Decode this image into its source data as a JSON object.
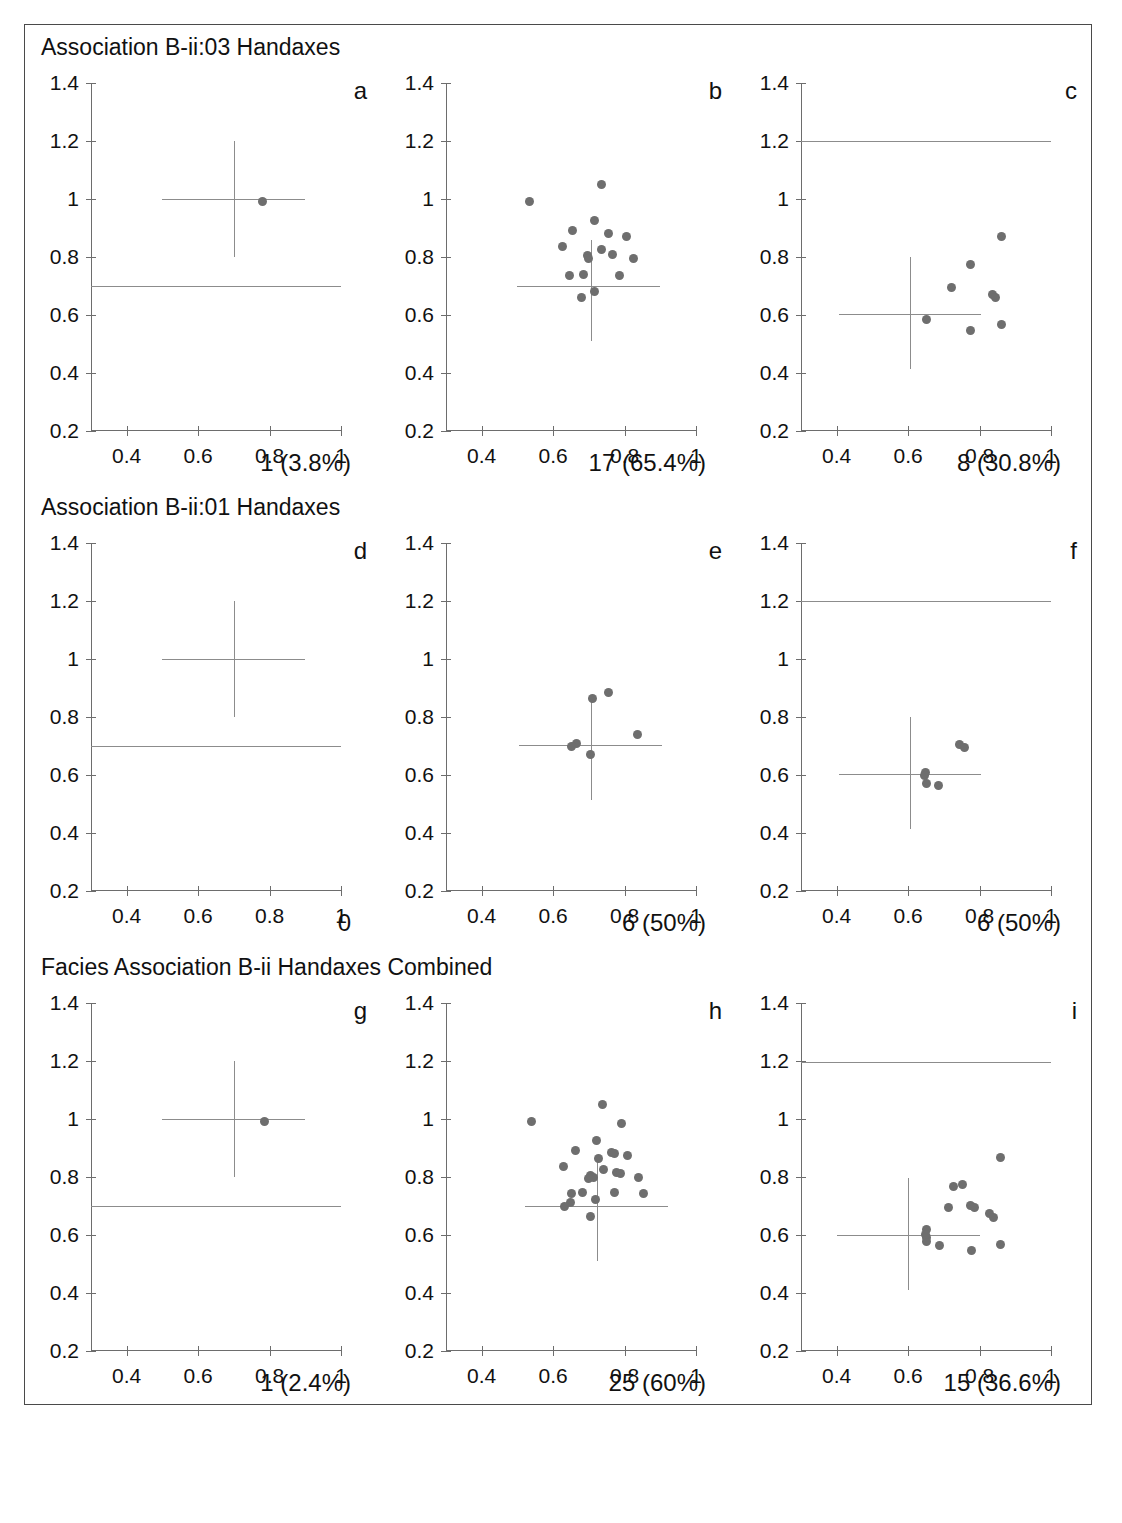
{
  "figure": {
    "rows": [
      {
        "title": "Association B-ii:03 Handaxes",
        "panels": [
          {
            "letter": "a",
            "count_label": "1 (3.8%)"
          },
          {
            "letter": "b",
            "count_label": "17 (65.4%)"
          },
          {
            "letter": "c",
            "count_label": "8 (30.8%)"
          }
        ]
      },
      {
        "title": "Association B-ii:01 Handaxes",
        "panels": [
          {
            "letter": "d",
            "count_label": "0"
          },
          {
            "letter": "e",
            "count_label": "6 (50%)"
          },
          {
            "letter": "f",
            "count_label": "6 (50%)"
          }
        ]
      },
      {
        "title": "Facies Association B-ii Handaxes Combined",
        "panels": [
          {
            "letter": "g",
            "count_label": "1 (2.4%)"
          },
          {
            "letter": "h",
            "count_label": "25 (60%)"
          },
          {
            "letter": "i",
            "count_label": "15 (36.6%)"
          }
        ]
      }
    ]
  },
  "chart_data": [
    {
      "id": "a",
      "type": "scatter",
      "title": "Association B-ii:03 Handaxes",
      "panel_letter": "a",
      "xlabel": "",
      "ylabel": "",
      "xlim": [
        0.3,
        1.0
      ],
      "ylim": [
        0.2,
        1.4
      ],
      "xticks": [
        0.4,
        0.6,
        0.8,
        1.0
      ],
      "xtick_labels": [
        "0.4",
        "0.6",
        "0.8",
        "1"
      ],
      "yticks": [
        0.2,
        0.4,
        0.6,
        0.8,
        1.0,
        1.2,
        1.4
      ],
      "ytick_labels": [
        "0.2",
        "0.4",
        "0.6",
        "0.8",
        "1",
        "1.2",
        "1.4"
      ],
      "grid": false,
      "legend": "none",
      "marker_color": "#6e6e6e",
      "annotation": "1 (3.8%)",
      "n_points": 1,
      "points": [
        {
          "x": 0.78,
          "y": 0.99
        }
      ],
      "crosshair": {
        "cx": 0.7,
        "cy": 1.0,
        "x_from": 0.5,
        "x_to": 0.9,
        "y_from": 0.8,
        "y_to": 1.2
      },
      "reference_lines": [
        {
          "orientation": "horizontal",
          "y": 0.7,
          "x_from": 0.3,
          "x_to": 1.0
        }
      ]
    },
    {
      "id": "b",
      "type": "scatter",
      "panel_letter": "b",
      "xlim": [
        0.3,
        1.0
      ],
      "ylim": [
        0.2,
        1.4
      ],
      "xticks": [
        0.4,
        0.6,
        0.8,
        1.0
      ],
      "yticks": [
        0.2,
        0.4,
        0.6,
        0.8,
        1.0,
        1.2,
        1.4
      ],
      "grid": false,
      "marker_color": "#6e6e6e",
      "annotation": "17 (65.4%)",
      "n_points": 17,
      "points": [
        {
          "x": 0.535,
          "y": 0.99
        },
        {
          "x": 0.735,
          "y": 1.05
        },
        {
          "x": 0.715,
          "y": 0.925
        },
        {
          "x": 0.655,
          "y": 0.89
        },
        {
          "x": 0.755,
          "y": 0.88
        },
        {
          "x": 0.805,
          "y": 0.87
        },
        {
          "x": 0.625,
          "y": 0.835
        },
        {
          "x": 0.735,
          "y": 0.825
        },
        {
          "x": 0.695,
          "y": 0.805
        },
        {
          "x": 0.7,
          "y": 0.795
        },
        {
          "x": 0.765,
          "y": 0.81
        },
        {
          "x": 0.825,
          "y": 0.795
        },
        {
          "x": 0.645,
          "y": 0.735
        },
        {
          "x": 0.685,
          "y": 0.74
        },
        {
          "x": 0.785,
          "y": 0.735
        },
        {
          "x": 0.715,
          "y": 0.68
        },
        {
          "x": 0.68,
          "y": 0.66
        }
      ],
      "crosshair": {
        "cx": 0.705,
        "cy": 0.7,
        "x_from": 0.5,
        "x_to": 0.9,
        "y_from": 0.51,
        "y_to": 0.86
      },
      "reference_lines": []
    },
    {
      "id": "c",
      "type": "scatter",
      "panel_letter": "c",
      "xlim": [
        0.3,
        1.0
      ],
      "ylim": [
        0.2,
        1.4
      ],
      "xticks": [
        0.4,
        0.6,
        0.8,
        1.0
      ],
      "yticks": [
        0.2,
        0.4,
        0.6,
        0.8,
        1.0,
        1.2,
        1.4
      ],
      "grid": false,
      "marker_color": "#6e6e6e",
      "annotation": "8 (30.8%)",
      "n_points": 8,
      "points": [
        {
          "x": 0.86,
          "y": 0.87
        },
        {
          "x": 0.775,
          "y": 0.775
        },
        {
          "x": 0.72,
          "y": 0.695
        },
        {
          "x": 0.835,
          "y": 0.67
        },
        {
          "x": 0.845,
          "y": 0.66
        },
        {
          "x": 0.65,
          "y": 0.585
        },
        {
          "x": 0.775,
          "y": 0.548
        },
        {
          "x": 0.86,
          "y": 0.568
        }
      ],
      "crosshair": {
        "cx": 0.605,
        "cy": 0.605,
        "x_from": 0.405,
        "x_to": 0.805,
        "y_from": 0.415,
        "y_to": 0.8
      },
      "reference_lines": [
        {
          "orientation": "horizontal",
          "y": 1.2,
          "x_from": 0.3,
          "x_to": 1.0
        }
      ]
    },
    {
      "id": "d",
      "type": "scatter",
      "title": "Association B-ii:01 Handaxes",
      "panel_letter": "d",
      "xlim": [
        0.3,
        1.0
      ],
      "ylim": [
        0.2,
        1.4
      ],
      "xticks": [
        0.4,
        0.6,
        0.8,
        1.0
      ],
      "yticks": [
        0.2,
        0.4,
        0.6,
        0.8,
        1.0,
        1.2,
        1.4
      ],
      "grid": false,
      "marker_color": "#6e6e6e",
      "annotation": "0",
      "n_points": 0,
      "points": [],
      "crosshair": {
        "cx": 0.7,
        "cy": 1.0,
        "x_from": 0.5,
        "x_to": 0.9,
        "y_from": 0.8,
        "y_to": 1.2
      },
      "reference_lines": [
        {
          "orientation": "horizontal",
          "y": 0.7,
          "x_from": 0.3,
          "x_to": 1.0
        }
      ]
    },
    {
      "id": "e",
      "type": "scatter",
      "panel_letter": "e",
      "xlim": [
        0.3,
        1.0
      ],
      "ylim": [
        0.2,
        1.4
      ],
      "xticks": [
        0.4,
        0.6,
        0.8,
        1.0
      ],
      "yticks": [
        0.2,
        0.4,
        0.6,
        0.8,
        1.0,
        1.2,
        1.4
      ],
      "grid": false,
      "marker_color": "#6e6e6e",
      "annotation": "6 (50%)",
      "n_points": 6,
      "points": [
        {
          "x": 0.755,
          "y": 0.885
        },
        {
          "x": 0.71,
          "y": 0.865
        },
        {
          "x": 0.835,
          "y": 0.74
        },
        {
          "x": 0.665,
          "y": 0.71
        },
        {
          "x": 0.652,
          "y": 0.7
        },
        {
          "x": 0.705,
          "y": 0.672
        }
      ],
      "crosshair": {
        "cx": 0.705,
        "cy": 0.705,
        "x_from": 0.505,
        "x_to": 0.905,
        "y_from": 0.515,
        "y_to": 0.87
      },
      "reference_lines": []
    },
    {
      "id": "f",
      "type": "scatter",
      "panel_letter": "f",
      "xlim": [
        0.3,
        1.0
      ],
      "ylim": [
        0.2,
        1.4
      ],
      "xticks": [
        0.4,
        0.6,
        0.8,
        1.0
      ],
      "yticks": [
        0.2,
        0.4,
        0.6,
        0.8,
        1.0,
        1.2,
        1.4
      ],
      "grid": false,
      "marker_color": "#6e6e6e",
      "annotation": "6 (50%)",
      "n_points": 6,
      "points": [
        {
          "x": 0.745,
          "y": 0.705
        },
        {
          "x": 0.758,
          "y": 0.695
        },
        {
          "x": 0.648,
          "y": 0.608
        },
        {
          "x": 0.652,
          "y": 0.572
        },
        {
          "x": 0.685,
          "y": 0.565
        },
        {
          "x": 0.647,
          "y": 0.6
        }
      ],
      "crosshair": {
        "cx": 0.605,
        "cy": 0.605,
        "x_from": 0.405,
        "x_to": 0.805,
        "y_from": 0.415,
        "y_to": 0.8
      },
      "reference_lines": [
        {
          "orientation": "horizontal",
          "y": 1.2,
          "x_from": 0.3,
          "x_to": 1.0
        }
      ]
    },
    {
      "id": "g",
      "type": "scatter",
      "title": "Facies Association B-ii Handaxes Combined",
      "panel_letter": "g",
      "xlim": [
        0.3,
        1.0
      ],
      "ylim": [
        0.2,
        1.4
      ],
      "xticks": [
        0.4,
        0.6,
        0.8,
        1.0
      ],
      "yticks": [
        0.2,
        0.4,
        0.6,
        0.8,
        1.0,
        1.2,
        1.4
      ],
      "grid": false,
      "marker_color": "#6e6e6e",
      "annotation": "1 (2.4%)",
      "n_points": 1,
      "points": [
        {
          "x": 0.785,
          "y": 0.99
        }
      ],
      "crosshair": {
        "cx": 0.7,
        "cy": 1.0,
        "x_from": 0.5,
        "x_to": 0.9,
        "y_from": 0.8,
        "y_to": 1.2
      },
      "reference_lines": [
        {
          "orientation": "horizontal",
          "y": 0.7,
          "x_from": 0.3,
          "x_to": 1.0
        }
      ]
    },
    {
      "id": "h",
      "type": "scatter",
      "panel_letter": "h",
      "xlim": [
        0.3,
        1.0
      ],
      "ylim": [
        0.2,
        1.4
      ],
      "xticks": [
        0.4,
        0.6,
        0.8,
        1.0
      ],
      "yticks": [
        0.2,
        0.4,
        0.6,
        0.8,
        1.0,
        1.2,
        1.4
      ],
      "grid": false,
      "marker_color": "#6e6e6e",
      "annotation": "25 (60%)",
      "n_points": 25,
      "points": [
        {
          "x": 0.538,
          "y": 0.99
        },
        {
          "x": 0.738,
          "y": 1.05
        },
        {
          "x": 0.792,
          "y": 0.985
        },
        {
          "x": 0.722,
          "y": 0.925
        },
        {
          "x": 0.662,
          "y": 0.89
        },
        {
          "x": 0.762,
          "y": 0.885
        },
        {
          "x": 0.772,
          "y": 0.882
        },
        {
          "x": 0.808,
          "y": 0.875
        },
        {
          "x": 0.728,
          "y": 0.865
        },
        {
          "x": 0.628,
          "y": 0.835
        },
        {
          "x": 0.742,
          "y": 0.825
        },
        {
          "x": 0.778,
          "y": 0.815
        },
        {
          "x": 0.788,
          "y": 0.812
        },
        {
          "x": 0.705,
          "y": 0.805
        },
        {
          "x": 0.712,
          "y": 0.8
        },
        {
          "x": 0.698,
          "y": 0.795
        },
        {
          "x": 0.838,
          "y": 0.798
        },
        {
          "x": 0.652,
          "y": 0.742
        },
        {
          "x": 0.682,
          "y": 0.748
        },
        {
          "x": 0.772,
          "y": 0.748
        },
        {
          "x": 0.852,
          "y": 0.742
        },
        {
          "x": 0.648,
          "y": 0.712
        },
        {
          "x": 0.632,
          "y": 0.698
        },
        {
          "x": 0.718,
          "y": 0.722
        },
        {
          "x": 0.705,
          "y": 0.665
        }
      ],
      "crosshair": {
        "cx": 0.722,
        "cy": 0.7,
        "x_from": 0.522,
        "x_to": 0.922,
        "y_from": 0.51,
        "y_to": 0.87
      },
      "reference_lines": []
    },
    {
      "id": "i",
      "type": "scatter",
      "panel_letter": "i",
      "xlim": [
        0.3,
        1.0
      ],
      "ylim": [
        0.2,
        1.4
      ],
      "xticks": [
        0.4,
        0.6,
        0.8,
        1.0
      ],
      "yticks": [
        0.2,
        0.4,
        0.6,
        0.8,
        1.0,
        1.2,
        1.4
      ],
      "grid": false,
      "marker_color": "#6e6e6e",
      "annotation": "15 (36.6%)",
      "n_points": 15,
      "points": [
        {
          "x": 0.858,
          "y": 0.868
        },
        {
          "x": 0.752,
          "y": 0.775
        },
        {
          "x": 0.728,
          "y": 0.768
        },
        {
          "x": 0.775,
          "y": 0.702
        },
        {
          "x": 0.785,
          "y": 0.695
        },
        {
          "x": 0.712,
          "y": 0.695
        },
        {
          "x": 0.828,
          "y": 0.675
        },
        {
          "x": 0.838,
          "y": 0.662
        },
        {
          "x": 0.652,
          "y": 0.618
        },
        {
          "x": 0.652,
          "y": 0.592
        },
        {
          "x": 0.652,
          "y": 0.578
        },
        {
          "x": 0.688,
          "y": 0.565
        },
        {
          "x": 0.778,
          "y": 0.548
        },
        {
          "x": 0.858,
          "y": 0.568
        },
        {
          "x": 0.648,
          "y": 0.602
        }
      ],
      "crosshair": {
        "cx": 0.6,
        "cy": 0.6,
        "x_from": 0.4,
        "x_to": 0.8,
        "y_from": 0.41,
        "y_to": 0.795
      },
      "reference_lines": [
        {
          "orientation": "horizontal",
          "y": 1.195,
          "x_from": 0.3,
          "x_to": 1.0
        }
      ]
    }
  ]
}
